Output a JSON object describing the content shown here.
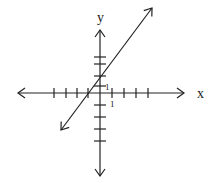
{
  "chart_data": {
    "type": "line",
    "title": "",
    "xlabel": "x",
    "ylabel": "y",
    "tick_labels": {
      "x_unit": "1",
      "y_unit": "1"
    },
    "x_ticks": [
      -4,
      -3,
      -2,
      -1,
      1,
      2,
      3,
      4
    ],
    "y_ticks": [
      -4,
      -3,
      -2,
      -1,
      1,
      2,
      3,
      4
    ],
    "line": {
      "description": "straight line with arrows at both ends",
      "x_intercept": -1,
      "y_intercept": 1.5,
      "slope": 1.4
    },
    "grid": false
  },
  "colors": {
    "stroke": "#222222",
    "background": "#ffffff"
  },
  "geometry": {
    "origin": [
      100,
      93
    ],
    "x_axis": [
      18,
      184
    ],
    "y_axis": [
      30,
      176
    ],
    "x_ticks_px": [
      54,
      66,
      77,
      88,
      112,
      124,
      136,
      148
    ],
    "y_ticks_px": [
      57,
      64,
      76,
      86,
      105,
      117,
      129,
      141
    ],
    "line_px": {
      "x1": 61,
      "y1": 130,
      "x2": 152,
      "y2": 8
    }
  }
}
